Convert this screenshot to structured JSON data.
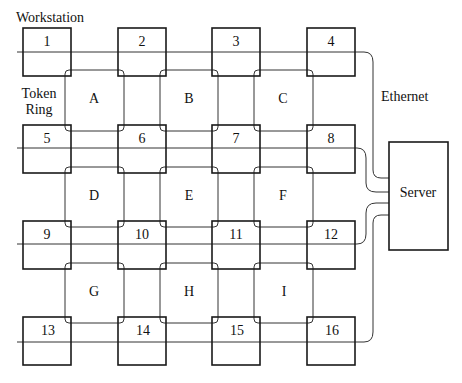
{
  "labels": {
    "workstation": "Workstation",
    "token_ring_line1": "Token",
    "token_ring_line2": "Ring",
    "ethernet": "Ethernet",
    "server": "Server"
  },
  "workstations": [
    "1",
    "2",
    "3",
    "4",
    "5",
    "6",
    "7",
    "8",
    "9",
    "10",
    "11",
    "12",
    "13",
    "14",
    "15",
    "16"
  ],
  "rings": [
    "A",
    "B",
    "C",
    "D",
    "E",
    "F",
    "G",
    "H",
    "I"
  ],
  "colors": {
    "box_stroke": "#1a1a1a",
    "line_stroke": "#333333",
    "background": "#ffffff"
  }
}
